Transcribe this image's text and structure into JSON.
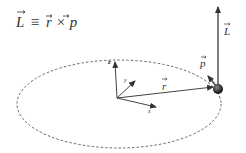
{
  "equation": {
    "lhs": "L",
    "op": "≡",
    "r": "r",
    "cross": "×",
    "p": "p"
  },
  "labels": {
    "z_axis": "z",
    "y_axis": "y",
    "x_axis": "x",
    "position_vector": "r",
    "momentum_vector": "p",
    "angular_momentum_vector": "L"
  },
  "colors": {
    "line": "#444444",
    "orbit": "#666666",
    "particle": "#222222",
    "text": "#333333"
  }
}
